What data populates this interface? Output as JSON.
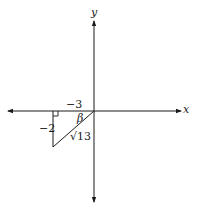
{
  "diagram": {
    "axes": {
      "x_label": "x",
      "y_label": "y"
    },
    "triangle": {
      "horizontal_leg_label": "−3",
      "vertical_leg_label": "−2",
      "hypotenuse_label": "√13",
      "angle_label": "β",
      "right_angle_marker": true
    },
    "colors": {
      "stroke": "#1a1a1a",
      "background": "#ffffff"
    }
  }
}
